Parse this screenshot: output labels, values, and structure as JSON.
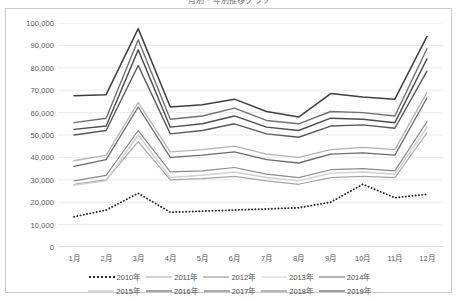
{
  "chart_title": "月別・年別推移グラフ",
  "chart_data": {
    "type": "line",
    "title": "月別・年別推移グラフ",
    "xlabel": "",
    "ylabel": "",
    "ylim": [
      0,
      100000
    ],
    "ytick_step": 10000,
    "grid": true,
    "legend_position": "bottom",
    "categories": [
      "1月",
      "2月",
      "3月",
      "4月",
      "5月",
      "6月",
      "7月",
      "8月",
      "9月",
      "10月",
      "11月",
      "12月"
    ],
    "ytick_labels": [
      "100,000",
      "90,000",
      "80,000",
      "70,000",
      "60,000",
      "50,000",
      "40,000",
      "30,000",
      "20,000",
      "10,000",
      "0"
    ],
    "ytick_values": [
      100000,
      90000,
      80000,
      70000,
      60000,
      50000,
      40000,
      30000,
      20000,
      10000,
      0
    ],
    "series": [
      {
        "name": "2010年",
        "style": "dotted",
        "color": "#262626",
        "width": 1.9,
        "values": [
          13500,
          16500,
          24000,
          15500,
          16000,
          16500,
          17000,
          17500,
          20000,
          28000,
          22000,
          23500
        ]
      },
      {
        "name": "2011年",
        "style": "solid",
        "color": "#a6a6a6",
        "width": 1.2,
        "values": [
          28000,
          30000,
          47000,
          30000,
          30500,
          31500,
          29500,
          28000,
          31000,
          31500,
          31000,
          51000
        ]
      },
      {
        "name": "2012年",
        "style": "solid",
        "color": "#8c8c8c",
        "width": 1.2,
        "values": [
          29500,
          32000,
          52000,
          33500,
          34000,
          35500,
          32500,
          31000,
          34500,
          35000,
          34000,
          56000
        ]
      },
      {
        "name": "2013年",
        "style": "solid",
        "color": "#d0d0d0",
        "width": 1.4,
        "values": [
          27500,
          29500,
          50000,
          31000,
          32000,
          33500,
          31000,
          29500,
          33000,
          33500,
          32500,
          53500
        ]
      },
      {
        "name": "2014年",
        "style": "solid",
        "color": "#6b6b6b",
        "width": 1.3,
        "values": [
          36000,
          39000,
          62500,
          40000,
          41000,
          42500,
          39000,
          37500,
          41500,
          42000,
          41000,
          66500
        ]
      },
      {
        "name": "2015年",
        "style": "solid",
        "color": "#b3b3b3",
        "width": 1.3,
        "values": [
          38500,
          41000,
          64500,
          42500,
          43500,
          45000,
          41500,
          40000,
          43500,
          44500,
          43500,
          69000
        ]
      },
      {
        "name": "2016年",
        "style": "solid",
        "color": "#4d4d4d",
        "width": 1.4,
        "values": [
          52500,
          54000,
          88000,
          53500,
          55000,
          58500,
          53500,
          52000,
          57500,
          57000,
          55500,
          84000
        ]
      },
      {
        "name": "2017年",
        "style": "solid",
        "color": "#595959",
        "width": 1.4,
        "values": [
          50000,
          52000,
          81000,
          50500,
          52000,
          55000,
          50500,
          49000,
          54000,
          54500,
          53000,
          78500
        ]
      },
      {
        "name": "2018年",
        "style": "solid",
        "color": "#707070",
        "width": 1.4,
        "values": [
          55500,
          57500,
          92500,
          57000,
          58500,
          62000,
          56500,
          55000,
          60500,
          60000,
          58500,
          88500
        ]
      },
      {
        "name": "2019年",
        "style": "solid",
        "color": "#3f3f3f",
        "width": 1.5,
        "values": [
          67500,
          68000,
          97500,
          62500,
          63500,
          66000,
          60500,
          58000,
          68500,
          67000,
          66000,
          94000
        ]
      }
    ]
  }
}
